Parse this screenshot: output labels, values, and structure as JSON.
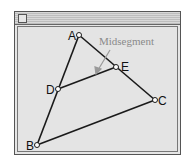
{
  "window": {
    "title": ""
  },
  "diagram": {
    "annotation": "Midsegment",
    "points": [
      {
        "name": "A",
        "x": 79,
        "y": 35
      },
      {
        "name": "B",
        "x": 37,
        "y": 145
      },
      {
        "name": "C",
        "x": 155,
        "y": 100
      },
      {
        "name": "D",
        "x": 58,
        "y": 89
      },
      {
        "name": "E",
        "x": 116,
        "y": 67
      }
    ],
    "segments": [
      [
        "A",
        "B"
      ],
      [
        "A",
        "C"
      ],
      [
        "B",
        "C"
      ],
      [
        "D",
        "E"
      ]
    ],
    "colors": {
      "line": "#1a1a1a",
      "annotation": "#8a8a8a",
      "background": "#e4e4e4"
    }
  }
}
